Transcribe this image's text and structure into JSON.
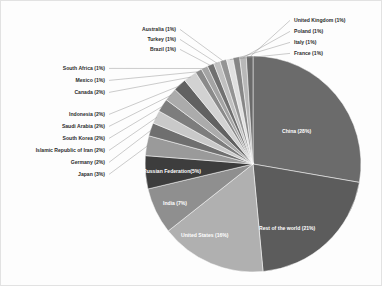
{
  "chart_data": {
    "type": "pie",
    "title": "",
    "subtitle": "",
    "units": "percent",
    "legend": "none",
    "labels_format": "Name (N%)",
    "start_angle_deg": 0,
    "direction": "clockwise",
    "categories": [
      "China",
      "Rest of the world",
      "United States",
      "India",
      "Russian Federation",
      "Japan",
      "Germany",
      "Islamic Republic of Iran",
      "South Korea",
      "Saudi Arabia",
      "Indonesia",
      "Canada",
      "Mexico",
      "South Africa",
      "Brazil",
      "Turkey",
      "Australia",
      "France",
      "Italy",
      "Poland",
      "United Kingdom"
    ],
    "values": [
      28,
      21,
      16,
      7,
      5,
      3,
      2,
      2,
      2,
      2,
      2,
      2,
      1,
      1,
      1,
      1,
      1,
      1,
      1,
      1,
      1
    ],
    "colors": [
      "#6b6b6b",
      "#5c5c5c",
      "#b0b0b0",
      "#8f8f8f",
      "#3d3d3d",
      "#9a9a9a",
      "#6f6f6f",
      "#c9c9c9",
      "#7d7d7d",
      "#ababab",
      "#616161",
      "#d2d2d2",
      "#8a8a8a",
      "#a4a4a4",
      "#707070",
      "#c0c0c0",
      "#949494",
      "#e0e0e0",
      "#868686",
      "#b8b8b8",
      "#6a6a6a"
    ],
    "slices": [
      {
        "name": "China",
        "label": "China (28%)",
        "value": 28,
        "placement": "inside"
      },
      {
        "name": "Rest of the world",
        "label": "Rest of the world (21%)",
        "value": 21,
        "placement": "inside"
      },
      {
        "name": "United States",
        "label": "United States (16%)",
        "value": 16,
        "placement": "inside"
      },
      {
        "name": "India",
        "label": "India (7%)",
        "value": 7,
        "placement": "inside"
      },
      {
        "name": "Russian Federation",
        "label": "Russian Federation(5%)",
        "value": 5,
        "placement": "inside"
      },
      {
        "name": "Japan",
        "label": "Japan (3%)",
        "value": 3,
        "placement": "outside-left"
      },
      {
        "name": "Germany",
        "label": "Germany (2%)",
        "value": 2,
        "placement": "outside-left"
      },
      {
        "name": "Islamic Republic of Iran",
        "label": "Islamic Republic of Iran (2%)",
        "value": 2,
        "placement": "outside-left"
      },
      {
        "name": "South Korea",
        "label": "South Korea (2%)",
        "value": 2,
        "placement": "outside-left"
      },
      {
        "name": "Saudi Arabia",
        "label": "Saudi Arabia (2%)",
        "value": 2,
        "placement": "outside-left"
      },
      {
        "name": "Indonesia",
        "label": "Indonesia (2%)",
        "value": 2,
        "placement": "outside-left"
      },
      {
        "name": "Canada",
        "label": "Canada (2%)",
        "value": 2,
        "placement": "outside-left"
      },
      {
        "name": "Mexico",
        "label": "Mexico (1%)",
        "value": 1,
        "placement": "outside-left"
      },
      {
        "name": "South Africa",
        "label": "South Africa (1%)",
        "value": 1,
        "placement": "outside-left"
      },
      {
        "name": "Brazil",
        "label": "Brazil (1%)",
        "value": 1,
        "placement": "outside-top"
      },
      {
        "name": "Turkey",
        "label": "Turkey (1%)",
        "value": 1,
        "placement": "outside-top"
      },
      {
        "name": "Australia",
        "label": "Australia (1%)",
        "value": 1,
        "placement": "outside-top"
      },
      {
        "name": "France",
        "label": "France (1%)",
        "value": 1,
        "placement": "outside-right"
      },
      {
        "name": "Italy",
        "label": "Italy (1%)",
        "value": 1,
        "placement": "outside-right"
      },
      {
        "name": "Poland",
        "label": "Poland (1%)",
        "value": 1,
        "placement": "outside-right"
      },
      {
        "name": "United Kingdom",
        "label": "United Kingdom (1%)",
        "value": 1,
        "placement": "outside-right"
      }
    ]
  },
  "geometry": {
    "cx": 253,
    "cy": 164,
    "r": 108
  }
}
